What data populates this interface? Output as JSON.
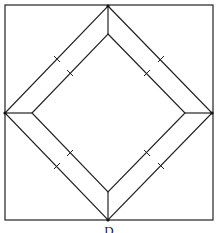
{
  "diagram": {
    "type": "geometry-figure",
    "stroke_color": "#222222",
    "outer_square": {
      "x1": 5,
      "y1": 5,
      "x2": 213,
      "y2": 220
    },
    "outer_diamond": {
      "top": [
        108,
        6
      ],
      "right": [
        212,
        113
      ],
      "bottom": [
        108,
        220
      ],
      "left": [
        5,
        113
      ]
    },
    "inner_diamond": {
      "top": [
        108,
        34
      ],
      "right": [
        185,
        113
      ],
      "bottom": [
        108,
        192
      ],
      "left": [
        32,
        113
      ]
    },
    "tick_marks": [
      {
        "x": 57,
        "y": 59,
        "side": "outer-upper-left"
      },
      {
        "x": 70,
        "y": 73,
        "side": "inner-upper-left"
      },
      {
        "x": 161,
        "y": 59,
        "side": "outer-upper-right"
      },
      {
        "x": 147,
        "y": 73,
        "side": "inner-upper-right"
      },
      {
        "x": 70,
        "y": 153,
        "side": "inner-lower-left"
      },
      {
        "x": 57,
        "y": 166,
        "side": "outer-lower-left"
      },
      {
        "x": 147,
        "y": 153,
        "side": "inner-lower-right"
      },
      {
        "x": 161,
        "y": 166,
        "side": "outer-lower-right"
      }
    ],
    "caption": "D"
  }
}
